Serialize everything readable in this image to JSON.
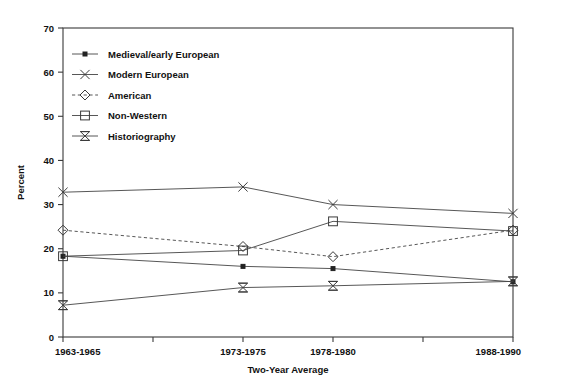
{
  "chart_data": {
    "type": "line",
    "title": "",
    "xlabel": "Two-Year Average",
    "ylabel": "Percent",
    "categories": [
      "1963-1965",
      "1973-1975",
      "1978-1980",
      "1988-1990"
    ],
    "x_tick_labels": [
      "1963-1965",
      "",
      "1973-1975",
      "1978-1980",
      "",
      "1988-1990"
    ],
    "y_tick_labels": [
      "0",
      "10",
      "20",
      "30",
      "40",
      "50",
      "60",
      "70"
    ],
    "y_ticks": [
      0,
      10,
      20,
      30,
      40,
      50,
      60,
      70
    ],
    "ylim": [
      0,
      70
    ],
    "grid": false,
    "legend_position": "upper-left-inside",
    "series": [
      {
        "name": "Medieval/early European",
        "marker": "filled-square-small",
        "linestyle": "solid",
        "values": [
          18.3,
          16.0,
          15.5,
          12.5
        ]
      },
      {
        "name": "Modern European",
        "marker": "x-cross",
        "linestyle": "solid",
        "values": [
          32.8,
          34.0,
          30.0,
          28.0
        ]
      },
      {
        "name": "American",
        "marker": "diamond",
        "linestyle": "dashed",
        "values": [
          24.2,
          20.5,
          18.2,
          24.2
        ]
      },
      {
        "name": "Non-Western",
        "marker": "square",
        "linestyle": "solid",
        "values": [
          18.3,
          19.6,
          26.2,
          24.0
        ]
      },
      {
        "name": "Historiography",
        "marker": "bowtie",
        "linestyle": "solid",
        "values": [
          7.2,
          11.2,
          11.6,
          12.6
        ]
      }
    ]
  },
  "colors": {
    "axis": "#3a3a3a",
    "text": "#111111",
    "line": "#444444",
    "background": "#ffffff"
  }
}
